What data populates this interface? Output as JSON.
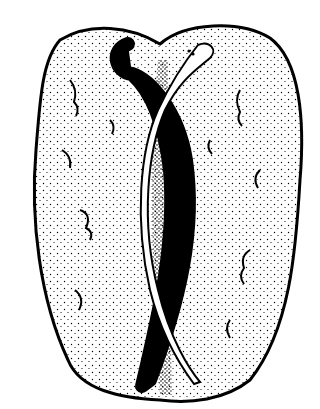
{
  "image": {
    "subject": "Line illustration of two snakes, one black and one white, crossing over a stippled leaf-shaped stone",
    "colors": {
      "background": "#ffffff",
      "ink": "#000000"
    }
  }
}
